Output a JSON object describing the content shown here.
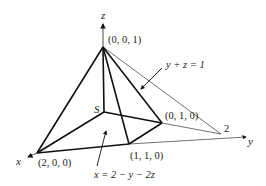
{
  "diagram": {
    "axes": {
      "x_label": "x",
      "y_label": "y",
      "z_label": "z"
    },
    "vertices": {
      "apex": "(0, 0, 1)",
      "x_corner": "(2, 0, 0)",
      "y_corner": "(0, 1, 0)",
      "mid_corner": "(1, 1, 0)",
      "y_intercept": "2"
    },
    "region_label": "S",
    "plane_labels": {
      "top_plane": "y + z = 1",
      "bottom_plane": "x = 2 − y − 2z"
    },
    "colors": {
      "stroke": "#111111",
      "thin_stroke": "#333333"
    }
  }
}
